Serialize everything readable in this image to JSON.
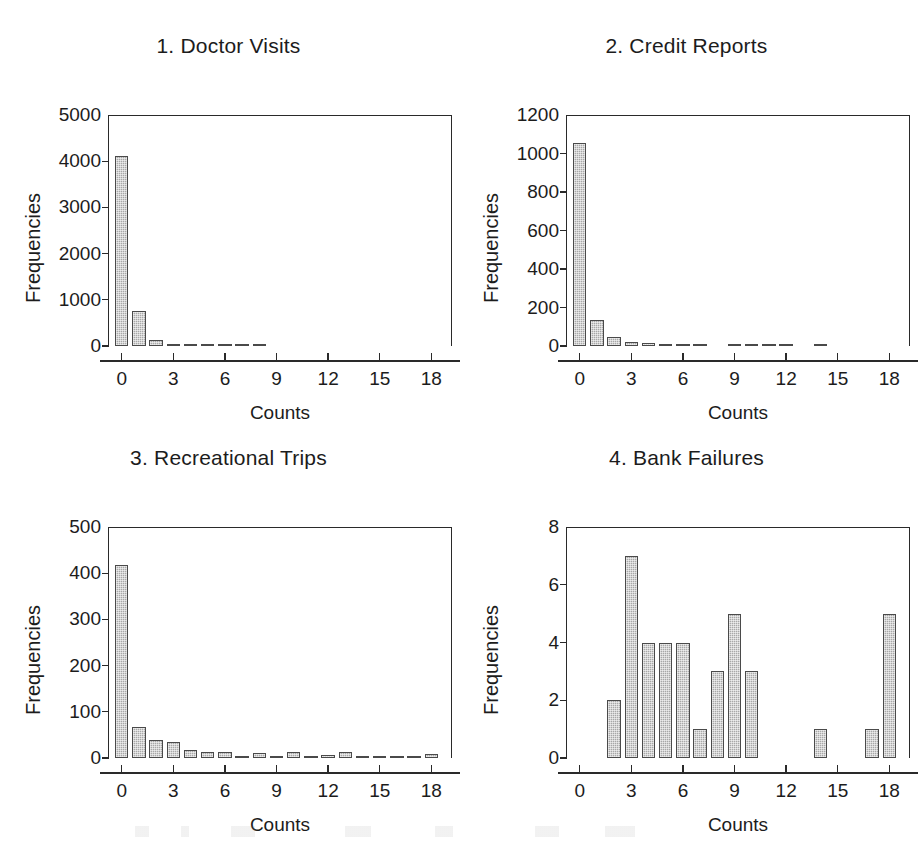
{
  "figure": {
    "panel_width": 457,
    "panel_height": 400
  },
  "panels": [
    {
      "title": "1. Doctor Visits",
      "ylabel": "Frequencies",
      "xlabel": "Counts"
    },
    {
      "title": "2. Credit Reports",
      "ylabel": "Frequencies",
      "xlabel": "Counts"
    },
    {
      "title": "3. Recreational Trips",
      "ylabel": "Frequencies",
      "xlabel": "Counts"
    },
    {
      "title": "4. Bank Failures",
      "ylabel": "Frequencies",
      "xlabel": "Counts"
    }
  ],
  "chart_data": [
    {
      "type": "bar",
      "title": "1. Doctor Visits",
      "xlabel": "Counts",
      "ylabel": "Frequencies",
      "categories": [
        0,
        1,
        2,
        3,
        4,
        5,
        6,
        7,
        8
      ],
      "values": [
        4110,
        760,
        130,
        40,
        25,
        18,
        14,
        10,
        8
      ],
      "xlim": [
        -0.8,
        19.2
      ],
      "ylim": [
        0,
        5000
      ],
      "xticks": [
        0,
        3,
        6,
        9,
        12,
        15,
        18
      ],
      "yticks": [
        0,
        1000,
        2000,
        3000,
        4000,
        5000
      ],
      "grid": false,
      "legend": false,
      "bar_color": "#a8a8a8",
      "bar_edge_color": "#4a4a4a"
    },
    {
      "type": "bar",
      "title": "2. Credit Reports",
      "xlabel": "Counts",
      "ylabel": "Frequencies",
      "categories": [
        0,
        1,
        2,
        3,
        4,
        5,
        6,
        7,
        9,
        10,
        11,
        12,
        14
      ],
      "values": [
        1055,
        135,
        45,
        20,
        14,
        11,
        8,
        7,
        5,
        5,
        5,
        4,
        3
      ],
      "xlim": [
        -0.8,
        19.2
      ],
      "ylim": [
        0,
        1200
      ],
      "xticks": [
        0,
        3,
        6,
        9,
        12,
        15,
        18
      ],
      "yticks": [
        0,
        200,
        400,
        600,
        800,
        1000,
        1200
      ],
      "grid": false,
      "legend": false,
      "bar_color": "#a8a8a8",
      "bar_edge_color": "#4a4a4a"
    },
    {
      "type": "bar",
      "title": "3. Recreational Trips",
      "xlabel": "Counts",
      "ylabel": "Frequencies",
      "categories": [
        0,
        1,
        2,
        3,
        4,
        5,
        6,
        7,
        8,
        9,
        10,
        11,
        12,
        13,
        14,
        15,
        16,
        17,
        18
      ],
      "values": [
        417,
        68,
        38,
        34,
        17,
        13,
        13,
        4,
        11,
        3,
        14,
        3,
        6,
        14,
        3,
        3,
        3,
        2,
        8
      ],
      "xlim": [
        -0.8,
        19.2
      ],
      "ylim": [
        0,
        500
      ],
      "xticks": [
        0,
        3,
        6,
        9,
        12,
        15,
        18
      ],
      "yticks": [
        0,
        100,
        200,
        300,
        400,
        500
      ],
      "grid": false,
      "legend": false,
      "bar_color": "#a8a8a8",
      "bar_edge_color": "#4a4a4a"
    },
    {
      "type": "bar",
      "title": "4. Bank Failures",
      "xlabel": "Counts",
      "ylabel": "Frequencies",
      "categories": [
        2,
        3,
        4,
        5,
        6,
        7,
        8,
        9,
        10,
        14,
        17,
        18
      ],
      "values": [
        2,
        7,
        4,
        4,
        4,
        1,
        3,
        5,
        3,
        1,
        1,
        5
      ],
      "xlim": [
        -0.8,
        19.2
      ],
      "ylim": [
        0,
        8
      ],
      "xticks": [
        0,
        3,
        6,
        9,
        12,
        15,
        18
      ],
      "yticks": [
        0,
        2,
        4,
        6,
        8
      ],
      "grid": false,
      "legend": false,
      "bar_color": "#a8a8a8",
      "bar_edge_color": "#4a4a4a"
    }
  ]
}
